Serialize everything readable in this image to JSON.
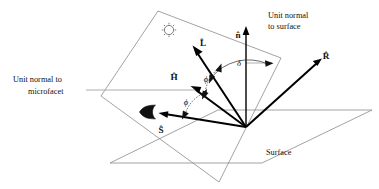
{
  "figure": {
    "background_color": "#ffffff",
    "line_color": "#000000",
    "plane_color": "#8a8a8a"
  },
  "annotations": {
    "unit_normal_microfacet_line1": "Unit normal to",
    "unit_normal_microfacet_line2": "microfacet",
    "unit_normal_surface_line1": "Unit normal",
    "unit_normal_surface_line2": "to surface",
    "surface_label": "Surface"
  },
  "vectors": [
    {
      "id": "n",
      "label": "n̂",
      "name": "unit-normal-to-surface",
      "description": "surface normal, points straight up"
    },
    {
      "id": "L",
      "label": "L̂",
      "name": "light-direction",
      "description": "direction to light source"
    },
    {
      "id": "H",
      "label": "Ĥ",
      "name": "half-vector-microfacet-normal",
      "description": "unit normal to microfacet"
    },
    {
      "id": "R",
      "label": "R̂",
      "name": "reflection-direction",
      "description": "mirror reflection direction"
    },
    {
      "id": "S",
      "label": "Ŝ",
      "name": "view-direction",
      "description": "direction to viewer / eye"
    }
  ],
  "angles": [
    {
      "id": "phi-upper",
      "label": "ϕ",
      "between": "H and L"
    },
    {
      "id": "phi-lower",
      "label": "ϕ",
      "between": "H and S"
    },
    {
      "id": "delta",
      "label": "δ",
      "between": "L and n"
    }
  ],
  "glyphs": [
    {
      "id": "sun",
      "name": "sun-icon",
      "meaning": "light source"
    },
    {
      "id": "eye",
      "name": "eye-icon",
      "meaning": "viewer"
    }
  ]
}
